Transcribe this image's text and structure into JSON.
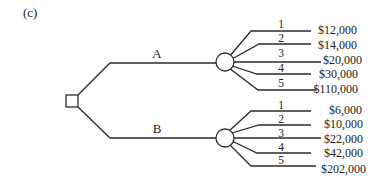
{
  "panel_label": "(c)",
  "decision_node": {
    "type": "decision",
    "shape": "square-icon"
  },
  "alternatives": [
    {
      "label": "A",
      "chance_node": "circle-icon",
      "outcomes": [
        {
          "number": "1",
          "value": "$12,000"
        },
        {
          "number": "2",
          "value": "$14,000"
        },
        {
          "number": "3",
          "value": "$20,000"
        },
        {
          "number": "4",
          "value": "$30,000"
        },
        {
          "number": "5",
          "value": "$110,000"
        }
      ]
    },
    {
      "label": "B",
      "chance_node": "circle-icon",
      "outcomes": [
        {
          "number": "1",
          "value": "$6,000"
        },
        {
          "number": "2",
          "value": "$10,000"
        },
        {
          "number": "3",
          "value": "$22,000"
        },
        {
          "number": "4",
          "value": "$42,000"
        },
        {
          "number": "5",
          "value": "$202,000"
        }
      ]
    }
  ]
}
